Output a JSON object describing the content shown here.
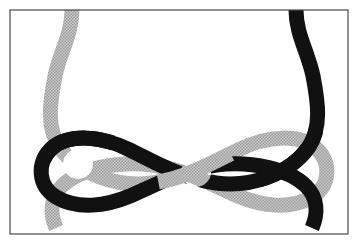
{
  "figure": {
    "canvas": {
      "width": 356,
      "height": 242,
      "background_color": "#ffffff",
      "margin_color": "#ffffff"
    },
    "frame": {
      "name": "image-border",
      "x": 10,
      "y": 10,
      "width": 338,
      "height": 224,
      "fill_color": "#ffffff",
      "stroke_color": "#4a4a4a",
      "stroke_width": 1.2
    },
    "strands": [
      {
        "id": "gray-strand",
        "label": "Light gray strand",
        "color": "#b4b4b4",
        "stroke_width": 15,
        "texture": "halftone-dither",
        "enters": {
          "edge": "top",
          "x": 72
        },
        "exits": {
          "edge": "bottom",
          "x": 312
        },
        "path": "M 72 10 C 72 34, 60 52, 55 76 C 50 102, 46 128, 60 148 C 78 173, 116 188, 152 183 C 186 178, 210 164, 238 150 C 268 135, 300 134, 316 148 C 332 163, 330 186, 312 197 C 290 210, 262 206, 238 196 C 210 184, 186 170, 152 165 C 116 160, 78 170, 62 186 C 50 198, 50 214, 56 228"
      },
      {
        "id": "black-strand",
        "label": "Black strand",
        "color": "#111111",
        "stroke_width": 15,
        "texture": "solid",
        "enters": {
          "edge": "top",
          "x": 296
        },
        "exits": {
          "edge": "bottom",
          "x": 66
        },
        "path": "M 296 10 C 296 34, 308 52, 313 76 C 318 102, 322 128, 308 148 C 290 173, 252 188, 216 183 C 182 178, 158 164, 130 150 C 100 135, 68 134, 52 148 C 36 163, 38 186, 56 197 C 78 210, 106 206, 130 196 C 158 184, 182 170, 216 165 C 252 160, 290 170, 306 186 C 318 198, 318 214, 312 228"
      }
    ],
    "crossings": [
      {
        "id": "crossing-left",
        "label": "Left crossing",
        "x": 78,
        "y": 164,
        "over": "black-strand",
        "under": "gray-strand"
      },
      {
        "id": "crossing-center",
        "label": "Center crossing",
        "x": 196,
        "y": 172,
        "over": "gray-strand",
        "under": "black-strand"
      },
      {
        "id": "crossing-right",
        "label": "Right crossing",
        "x": 296,
        "y": 164,
        "over": "black-strand",
        "under": "gray-strand"
      }
    ],
    "legend": {
      "visible": false,
      "entries": []
    },
    "labels": {
      "visible": false,
      "items": []
    }
  }
}
